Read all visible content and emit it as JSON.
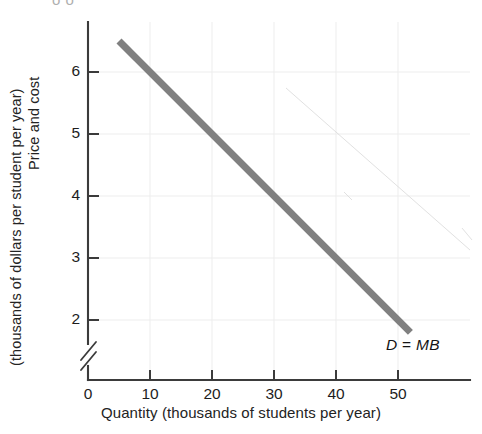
{
  "figure": {
    "title_remnant": "o o",
    "background_color": "#ffffff"
  },
  "axes": {
    "y": {
      "label_line1": "Price and cost",
      "label_line2": "(thousands of dollars per student per year)",
      "ticks": [
        "2",
        "3",
        "4",
        "5",
        "6"
      ],
      "origin_label": "0",
      "has_axis_break": true,
      "axis_color": "#3b3b3b"
    },
    "x": {
      "label": "Quantity (thousands of students per year)",
      "ticks": [
        "0",
        "10",
        "20",
        "30",
        "40",
        "50"
      ],
      "axis_color": "#3b3b3b"
    }
  },
  "annotations": {
    "curve_label_symbol": "D",
    "curve_label_operator": "=",
    "curve_label_value": "MB"
  },
  "chart_data": {
    "type": "line",
    "title": "",
    "xlabel": "Quantity (thousands of students per year)",
    "ylabel": "Price and cost (thousands of dollars per student per year)",
    "xlim": [
      0,
      58
    ],
    "ylim": [
      1.4,
      6.9
    ],
    "y_axis_break": true,
    "xticks": [
      0,
      10,
      20,
      30,
      40,
      50
    ],
    "yticks": [
      2,
      3,
      4,
      5,
      6
    ],
    "grid": true,
    "grid_color": "#ededed",
    "legend": "none",
    "series": [
      {
        "name": "D = MB",
        "color": "#808080",
        "linewidth": 6,
        "x": [
          5,
          10,
          20,
          30,
          40,
          50,
          52
        ],
        "y": [
          6.5,
          6.0,
          5.0,
          4.0,
          3.0,
          2.0,
          1.8
        ],
        "equation": "P = 7 - 0.1Q"
      }
    ],
    "annotations": [
      {
        "text": "D = MB",
        "x": 45,
        "y": 1.35,
        "italic": true
      }
    ]
  }
}
